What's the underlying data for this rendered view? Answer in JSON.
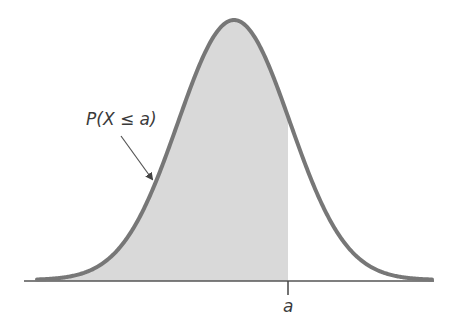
{
  "diagram": {
    "probability_label": "P(X ≤ a)",
    "axis_marker_label": "a",
    "colors": {
      "curve": "#777777",
      "fill": "#d9d9d9",
      "axis": "#555555",
      "text": "#3a3a3a"
    }
  }
}
